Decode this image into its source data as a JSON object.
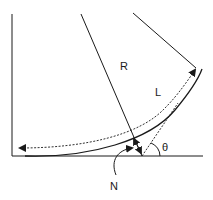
{
  "diagram": {
    "type": "geometry-curve-diagram",
    "colors": {
      "stroke": "#1a1a1a",
      "background": "#ffffff"
    },
    "labels": {
      "radius": "R",
      "arc_length": "L",
      "angle": "θ",
      "normal_point": "N"
    },
    "elements": [
      {
        "id": "vertical-axis",
        "kind": "line"
      },
      {
        "id": "horizontal-axis",
        "kind": "line"
      },
      {
        "id": "radius-line-1",
        "kind": "line",
        "label": "R"
      },
      {
        "id": "radius-line-2",
        "kind": "line"
      },
      {
        "id": "curve",
        "kind": "arc"
      },
      {
        "id": "arc-length-arrow",
        "kind": "dashed-double-arrow",
        "label": "L"
      },
      {
        "id": "chord-line",
        "kind": "dashed-line"
      },
      {
        "id": "angle-arc",
        "kind": "arc",
        "label": "θ"
      },
      {
        "id": "normal-pointer",
        "kind": "curved-arrow",
        "label": "N"
      }
    ]
  }
}
